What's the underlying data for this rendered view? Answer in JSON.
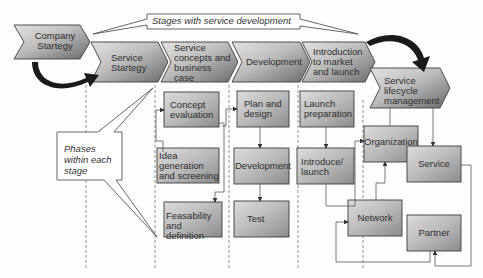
{
  "title_callout": {
    "text": "Stages with service development"
  },
  "phases_callout": {
    "text": "Phases within each stage"
  },
  "colors": {
    "chevron_light": "#d6d6d6",
    "chevron_dark": "#6f6f6f",
    "box_light": "#cfcfcf",
    "box_dark": "#8a8a8a",
    "stroke": "#444444",
    "arrow": "#1a1a1a"
  },
  "stages": [
    {
      "id": "company",
      "label": "Company Startegy"
    },
    {
      "id": "service-strategy",
      "label": "Service Startegy"
    },
    {
      "id": "concepts",
      "label": "Service concepts and business case"
    },
    {
      "id": "development",
      "label": "Development"
    },
    {
      "id": "introduction",
      "label": "Introduction to market and launch"
    },
    {
      "id": "lifecycle",
      "label": "Service lifecycle management"
    }
  ],
  "phases": {
    "concepts": [
      {
        "label": "Concept evaluation"
      },
      {
        "label": "Idea generation and screening"
      },
      {
        "label": "Feasability and definition"
      }
    ],
    "development": [
      {
        "label": "Plan and design"
      },
      {
        "label": "Development"
      },
      {
        "label": "Test"
      }
    ],
    "introduction": [
      {
        "label": "Launch preparation"
      },
      {
        "label": "Introduce/ launch"
      }
    ],
    "lifecycle": [
      {
        "label": "Organization"
      },
      {
        "label": "Service"
      },
      {
        "label": "Network"
      },
      {
        "label": "Partner"
      }
    ]
  }
}
